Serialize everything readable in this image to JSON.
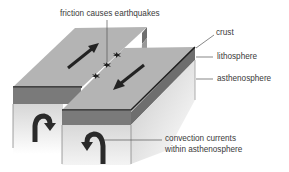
{
  "diagram": {
    "type": "transform plate boundary block diagram",
    "labels": {
      "friction": "friction causes earthquakes",
      "crust": "crust",
      "lithosphere": "lithosphere",
      "asthenosphere": "asthenosphere",
      "convection_line1": "convection currents",
      "convection_line2": "within asthenosphere"
    },
    "icons": {
      "plate_motion_left": "arrow-up-right",
      "plate_motion_right": "arrow-down-left",
      "earthquake_markers": "star-burst",
      "convection_left": "curved-arrow-clockwise",
      "convection_right": "curved-arrow-counterclockwise"
    },
    "colors": {
      "top_surface": "#b4b4b4",
      "crust_line": "#1e1e1e",
      "lithosphere": "#7a7a7a",
      "asthenosphere": "#d8d8d8",
      "side_face": "#8c8c8c",
      "arrow": "#2a2a2a",
      "leader_line": "#555555"
    }
  }
}
